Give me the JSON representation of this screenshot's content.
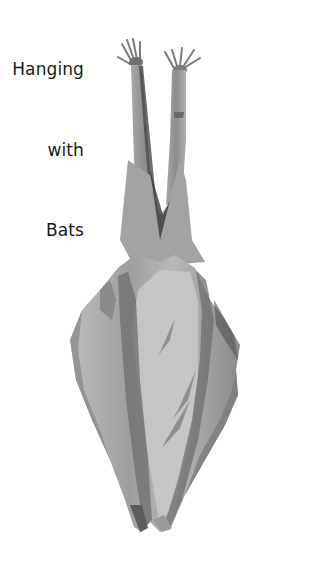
{
  "title": {
    "words": [
      "Hanging",
      "with",
      "Bats"
    ]
  },
  "illustration": {
    "subject": "watercolor hanging bat, wings folded",
    "palette": {
      "background": "#ffffff",
      "light_gray": "#c8c8c8",
      "mid_gray": "#9a9a9a",
      "dark_gray": "#5a5a5a",
      "text": "#1a1a1a"
    }
  }
}
